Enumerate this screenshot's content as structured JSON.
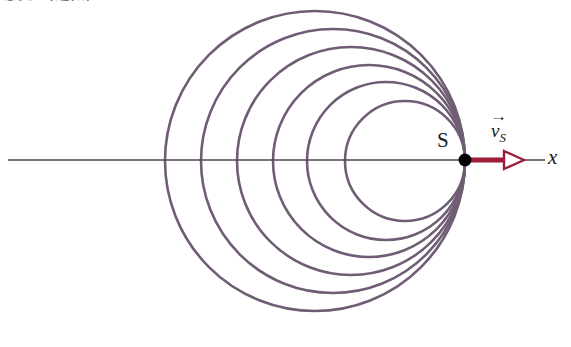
{
  "figure": {
    "title_partial": "ساختار موج",
    "source_point_label": "S",
    "axis_label": "x",
    "velocity_label": {
      "symbol": "v",
      "subscript": "S",
      "arrow": "→",
      "full": "v_S"
    }
  },
  "colors": {
    "wavefront": "#6f5d74",
    "axis": "#4a4a4a",
    "velocity_arrow": "#9e1c36",
    "source_dot": "#000000",
    "background": "#ffffff",
    "arrowhead_fill": "#ffffff"
  },
  "geometry": {
    "axis": {
      "x1": 8,
      "x2": 545,
      "y": 160,
      "stroke_width": 1.4
    },
    "source": {
      "x": 465,
      "y": 160,
      "radius": 6.5
    },
    "velocity_arrow": {
      "x_start": 466,
      "x_end": 524,
      "y": 160,
      "stroke_width": 5
    }
  },
  "chart_data": {
    "type": "scatter",
    "xlabel": "x",
    "ylabel": "",
    "legend": [],
    "annotations": [
      {
        "text": "S",
        "x": 448,
        "y": 145,
        "role": "source-label"
      },
      {
        "text": "v_S",
        "x": 500,
        "y": 122,
        "role": "velocity-vector-label"
      },
      {
        "text": "x",
        "x": 552,
        "y": 160,
        "role": "axis-label"
      }
    ],
    "wavefronts": [
      {
        "index": 1,
        "center_x": 405,
        "center_y": 161,
        "radius": 60
      },
      {
        "index": 2,
        "center_x": 386,
        "center_y": 161,
        "radius": 79
      },
      {
        "index": 3,
        "center_x": 369,
        "center_y": 161,
        "radius": 96
      },
      {
        "index": 4,
        "center_x": 351,
        "center_y": 161,
        "radius": 114
      },
      {
        "index": 5,
        "center_x": 333,
        "center_y": 161,
        "radius": 132
      },
      {
        "index": 6,
        "center_x": 315,
        "center_y": 161,
        "radius": 150
      }
    ],
    "wavefront_count": 6,
    "grid": false
  }
}
